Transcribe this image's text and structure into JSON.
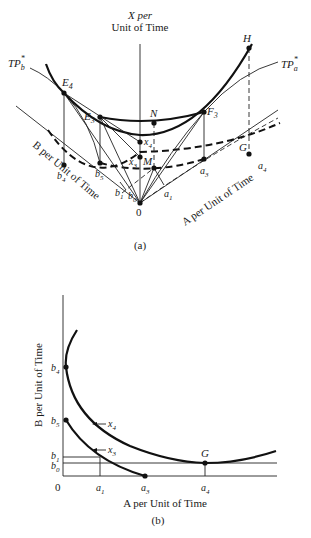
{
  "panel_a": {
    "caption": "(a)",
    "x_axis_label_line1": "X per",
    "x_axis_label_line2": "Unit of Time",
    "b_axis_label": "B per Unit of Time",
    "a_axis_label": "A per Unit of Time",
    "curve_labels": {
      "tp_b": "TP",
      "tp_b_sub": "b",
      "tp_b_sup": "*",
      "tp_a": "TP",
      "tp_a_sub": "a",
      "tp_a_sup": "*"
    },
    "points": {
      "E4": "E",
      "E4_sub": "4",
      "E3": "E",
      "E3_sub": "3",
      "F3": "F",
      "F3_sub": "3",
      "H": "H",
      "G": "G",
      "N": "N",
      "M": "M",
      "x4": "x",
      "x4_sub": "4",
      "x3": "x",
      "x3_sub": "3",
      "b4": "b",
      "b4_sub": "4",
      "b5": "b",
      "b5_sub": "5",
      "b1": "b",
      "b1_sub": "1",
      "b0": "b",
      "b0_sub": "0",
      "a1": "a",
      "a1_sub": "1",
      "a3": "a",
      "a3_sub": "3",
      "a4": "a",
      "a4_sub": "4",
      "origin": "0"
    }
  },
  "panel_b": {
    "caption": "(b)",
    "y_axis_label": "B per Unit of Time",
    "x_axis_label": "A per Unit of Time",
    "origin": "0",
    "y_ticks": [
      {
        "l": "b",
        "s": "4"
      },
      {
        "l": "b",
        "s": "5"
      },
      {
        "l": "b",
        "s": "1"
      },
      {
        "l": "b",
        "s": "0"
      }
    ],
    "x_ticks": [
      {
        "l": "a",
        "s": "1"
      },
      {
        "l": "a",
        "s": "3"
      },
      {
        "l": "a",
        "s": "4"
      }
    ],
    "curve_labels": {
      "x4": "x",
      "x4_sub": "4",
      "x3": "x",
      "x3_sub": "3"
    },
    "point_G": "G"
  }
}
